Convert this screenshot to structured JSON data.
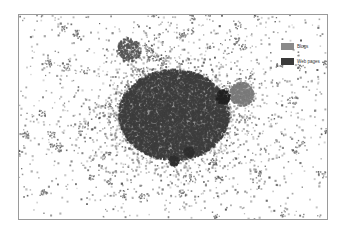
{
  "figure": {
    "type": "network-graph"
  },
  "legend": {
    "items": [
      {
        "label": "Blogs",
        "color": "#8a8a8a"
      },
      {
        "label": "Web pages",
        "color": "#3a3a3a"
      }
    ]
  },
  "clusters": [
    {
      "name": "core",
      "cx": 155,
      "cy": 100,
      "r": 48,
      "density": 0.95,
      "color": "#3d3d3d"
    },
    {
      "name": "top-cluster",
      "cx": 110,
      "cy": 35,
      "r": 12,
      "density": 0.6,
      "color": "#555555"
    },
    {
      "name": "right-blog-disc",
      "cx": 223,
      "cy": 79,
      "r": 12,
      "density": 0.85,
      "color": "#7a7a7a"
    },
    {
      "name": "right-web-disc",
      "cx": 204,
      "cy": 82,
      "r": 7,
      "density": 1.0,
      "color": "#222222"
    },
    {
      "name": "lower-disc-1",
      "cx": 170,
      "cy": 137,
      "r": 5,
      "density": 1.0,
      "color": "#2f2f2f"
    },
    {
      "name": "lower-disc-2",
      "cx": 155,
      "cy": 146,
      "r": 5,
      "density": 1.0,
      "color": "#2f2f2f"
    }
  ]
}
